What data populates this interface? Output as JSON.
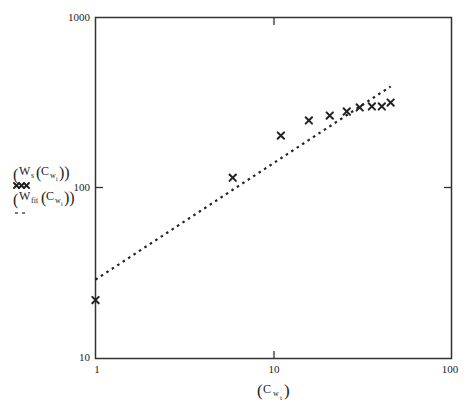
{
  "chart_data": {
    "type": "scatter",
    "title": "",
    "xlabel": "(C w_i)",
    "ylabel_legend": [
      {
        "label": "(W s(C w_i))",
        "style": "x-markers",
        "marker_glyph": "xxx"
      },
      {
        "label": "(W fit(C w_i))",
        "style": "dashed-line",
        "marker_glyph": "--"
      }
    ],
    "xscale": "log",
    "yscale": "log",
    "xlim": [
      1,
      100
    ],
    "ylim": [
      10,
      1000
    ],
    "x_ticks": [
      "1",
      "10",
      "100"
    ],
    "y_ticks": [
      "10",
      "100",
      "1000"
    ],
    "grid": false,
    "legend_position": "left",
    "series": [
      {
        "name": "W_s(C_w_i)",
        "kind": "scatter",
        "marker": "x",
        "x": [
          1.0,
          5.9,
          11.0,
          15.8,
          20.7,
          25.8,
          30.5,
          35.7,
          40.6,
          45.5
        ],
        "y": [
          22,
          115,
          203,
          249,
          266,
          281,
          297,
          301,
          301,
          317
        ]
      },
      {
        "name": "W_fit(C_w_i)",
        "kind": "line",
        "linestyle": "dotted",
        "x": [
          1.0,
          45.5
        ],
        "y": [
          29,
          394
        ]
      }
    ]
  },
  "labels": {
    "y_tick_1000": "1000",
    "y_tick_100": "100",
    "y_tick_10": "10",
    "x_tick_1": "1",
    "x_tick_10": "10",
    "x_tick_100": "100",
    "x_axis_main": "C",
    "x_axis_sub": "w",
    "x_axis_subsub": "i",
    "legend1_W": "W",
    "legend1_sub": "s",
    "legend1_C": "C",
    "legend1_w": "w",
    "legend1_i": "i",
    "legend1_marker": "xxx",
    "legend2_W": "W",
    "legend2_sub": "fit",
    "legend2_C": "C",
    "legend2_w": "w",
    "legend2_i": "i",
    "legend2_marker": "- -"
  },
  "colors": {
    "axis": "#333333",
    "marker": "#222222",
    "fit_line": "#222222",
    "background": "#ffffff"
  }
}
